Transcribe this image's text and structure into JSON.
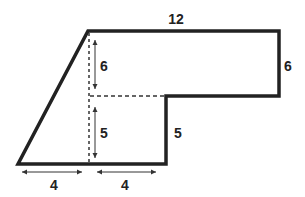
{
  "figure": {
    "stroke_color": "#222222",
    "labels": {
      "top_width": "12",
      "right_height": "6",
      "upper_inner_height": "6",
      "lower_inner_height": "5",
      "step_height": "5",
      "bottom_left_width": "4",
      "bottom_right_width": "4"
    }
  }
}
